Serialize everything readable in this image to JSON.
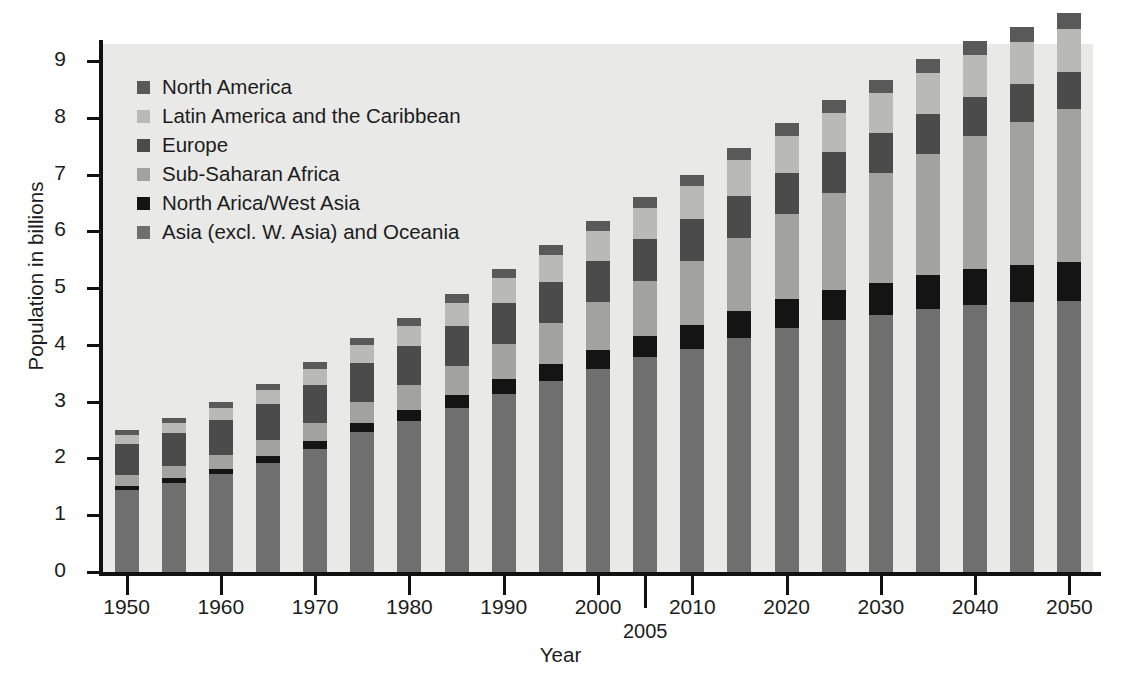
{
  "figure": {
    "background": "#e9e9e7",
    "xlabel": "Year",
    "ylabel": "Population in billions"
  },
  "axes": {
    "y_ticks": [
      "0",
      "1",
      "2",
      "3",
      "4",
      "5",
      "6",
      "7",
      "8",
      "9"
    ],
    "x_ticks": [
      "1950",
      "1960",
      "1970",
      "1980",
      "1990",
      "2000",
      "2010",
      "2020",
      "2030",
      "2040",
      "2050"
    ],
    "x_extra_tick": "2005"
  },
  "legend": {
    "items": [
      {
        "label": "North America",
        "color": "#595959"
      },
      {
        "label": "Latin America and the Caribbean",
        "color": "#b9b9b7"
      },
      {
        "label": "Europe",
        "color": "#4b4b4b"
      },
      {
        "label": "Sub-Saharan Africa",
        "color": "#a2a2a0"
      },
      {
        "label": "North Arica/West Asia",
        "color": "#141414"
      },
      {
        "label": "Asia (excl. W. Asia) and Oceania",
        "color": "#6f6f6f"
      }
    ]
  },
  "chart_data": {
    "type": "bar",
    "stacked": true,
    "title": "",
    "xlabel": "Year",
    "ylabel": "Population in billions",
    "ylim": [
      0,
      9.3
    ],
    "grid": false,
    "legend_position": "upper-left-inside",
    "categories": [
      "1950",
      "1955",
      "1960",
      "1965",
      "1970",
      "1975",
      "1980",
      "1985",
      "1990",
      "1995",
      "2000",
      "2005",
      "2010",
      "2015",
      "2020",
      "2025",
      "2030",
      "2035",
      "2040",
      "2045",
      "2050"
    ],
    "series": [
      {
        "name": "Asia (excl. W. Asia) and Oceania",
        "color": "#6f6f6f",
        "values": [
          1.44,
          1.56,
          1.72,
          1.92,
          2.17,
          2.46,
          2.66,
          2.89,
          3.14,
          3.36,
          3.57,
          3.78,
          3.93,
          4.13,
          4.3,
          4.43,
          4.52,
          4.63,
          4.71,
          4.75,
          4.78
        ]
      },
      {
        "name": "North Arica/West Asia",
        "color": "#141414",
        "values": [
          0.08,
          0.09,
          0.1,
          0.12,
          0.14,
          0.16,
          0.19,
          0.22,
          0.26,
          0.3,
          0.34,
          0.38,
          0.42,
          0.46,
          0.5,
          0.54,
          0.57,
          0.6,
          0.63,
          0.65,
          0.68
        ]
      },
      {
        "name": "Sub-Saharan Africa",
        "color": "#a2a2a0",
        "values": [
          0.18,
          0.21,
          0.24,
          0.28,
          0.32,
          0.38,
          0.44,
          0.52,
          0.61,
          0.72,
          0.84,
          0.97,
          1.12,
          1.3,
          1.5,
          1.71,
          1.93,
          2.14,
          2.34,
          2.52,
          2.69
        ]
      },
      {
        "name": "Europe",
        "color": "#4b4b4b",
        "values": [
          0.55,
          0.58,
          0.61,
          0.64,
          0.66,
          0.68,
          0.69,
          0.71,
          0.72,
          0.73,
          0.73,
          0.73,
          0.74,
          0.74,
          0.73,
          0.72,
          0.71,
          0.7,
          0.69,
          0.67,
          0.66
        ]
      },
      {
        "name": "Latin America and the Caribbean",
        "color": "#b9b9b7",
        "values": [
          0.17,
          0.19,
          0.22,
          0.25,
          0.29,
          0.32,
          0.36,
          0.4,
          0.44,
          0.48,
          0.52,
          0.56,
          0.59,
          0.62,
          0.65,
          0.68,
          0.7,
          0.72,
          0.73,
          0.74,
          0.75
        ]
      },
      {
        "name": "North America",
        "color": "#595959",
        "values": [
          0.08,
          0.09,
          0.1,
          0.11,
          0.12,
          0.13,
          0.14,
          0.15,
          0.16,
          0.17,
          0.18,
          0.19,
          0.2,
          0.21,
          0.22,
          0.23,
          0.24,
          0.25,
          0.26,
          0.27,
          0.28
        ]
      }
    ],
    "totals": [
      2.5,
      2.72,
      2.99,
      3.32,
      3.7,
      4.13,
      4.48,
      4.89,
      5.33,
      5.76,
      6.18,
      6.61,
      7.0,
      7.46,
      7.9,
      8.31,
      8.67,
      9.04,
      9.36,
      9.6,
      9.84
    ]
  }
}
